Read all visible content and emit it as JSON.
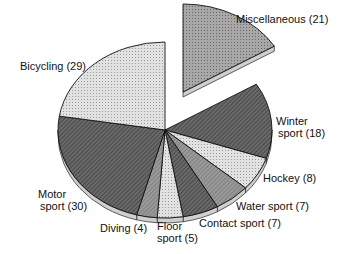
{
  "chart_data": {
    "type": "pie",
    "title": "",
    "total": 129,
    "slices": [
      {
        "label": "Miscellaneous",
        "value": 21,
        "exploded": true,
        "fill": "#9a9a9a",
        "pattern": "dots"
      },
      {
        "label": "Winter sport",
        "value": 18,
        "fill": "#555555",
        "pattern": "hatch"
      },
      {
        "label": "Hockey",
        "value": 8,
        "fill": "#d0d0d0",
        "pattern": "dots"
      },
      {
        "label": "Water sport",
        "value": 7,
        "fill": "#7a7a7a",
        "pattern": "hatch"
      },
      {
        "label": "Contact sport",
        "value": 7,
        "fill": "#555555",
        "pattern": "hatch"
      },
      {
        "label": "Floor sport",
        "value": 5,
        "fill": "#d0d0d0",
        "pattern": "dots"
      },
      {
        "label": "Diving",
        "value": 4,
        "fill": "#8a8a8a",
        "pattern": "hatch"
      },
      {
        "label": "Motor sport",
        "value": 30,
        "fill": "#555555",
        "pattern": "hatch"
      },
      {
        "label": "Bicycling",
        "value": 29,
        "fill": "#d6d6d6",
        "pattern": "dots"
      }
    ]
  },
  "labels": {
    "misc": "Miscellaneous (21)",
    "winter1": "Winter",
    "winter2": "sport (18)",
    "hockey": "Hockey (8)",
    "water": "Water sport (7)",
    "contact": "Contact sport (7)",
    "floor1": "Floor",
    "floor2": "sport (5)",
    "diving": "Diving (4)",
    "motor1": "Motor",
    "motor2": "sport (30)",
    "bicycling": "Bicycling (29)"
  }
}
